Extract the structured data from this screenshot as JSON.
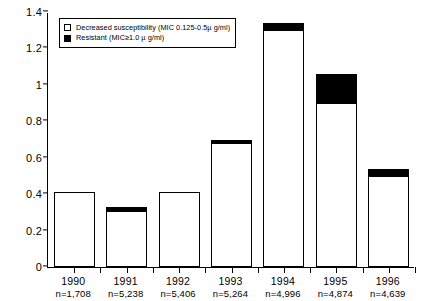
{
  "chart_data": {
    "type": "bar",
    "title": "",
    "subtitle": "",
    "xlabel": "",
    "ylabel": "",
    "stacked": true,
    "grid": false,
    "ylim": [
      0,
      1.4
    ],
    "ytick_labels": [
      "0",
      "0.2",
      "0.4",
      "0.6",
      "0.8",
      "1",
      "1.2",
      "1.4"
    ],
    "ytick_values": [
      0,
      0.2,
      0.4,
      0.6,
      0.8,
      1.0,
      1.2,
      1.4
    ],
    "categories": [
      "1990",
      "1991",
      "1992",
      "1993",
      "1994",
      "1995",
      "1996"
    ],
    "category_sublabels": [
      "n=1,708",
      "n=5,238",
      "n=5,406",
      "n=5,264",
      "n=4,996",
      "n=4,874",
      "n=4,639"
    ],
    "legend_position": "top-left",
    "series": [
      {
        "name": "Decreased susceptibility (MIC 0.125-0.5µ g/ml)",
        "color": "#ffffff",
        "values": [
          0.41,
          0.31,
          0.41,
          0.68,
          1.3,
          0.9,
          0.5
        ]
      },
      {
        "name": "Resistant (MIC≥1.0 µ g/ml)",
        "color": "#000000",
        "values": [
          0.0,
          0.02,
          0.0,
          0.02,
          0.04,
          0.16,
          0.04
        ]
      }
    ],
    "totals": [
      0.41,
      0.33,
      0.41,
      0.7,
      1.34,
      1.06,
      0.54
    ]
  },
  "legend": {
    "items": [
      {
        "swatch": "white",
        "label": "Decreased susceptibility (MIC 0.125-0.5µ g/ml)"
      },
      {
        "swatch": "black",
        "label": "Resistant (MIC≥1.0 µ g/ml)"
      }
    ]
  }
}
